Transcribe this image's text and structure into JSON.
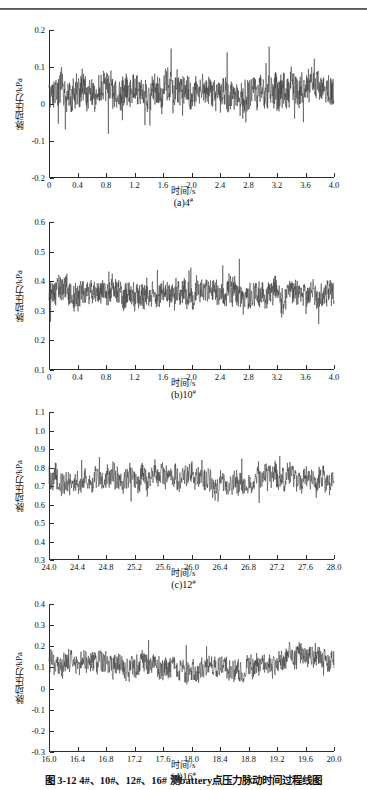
{
  "figure": {
    "caption": "图 3-12    4#、10#、12#、16# 测battery点压力脉动时间过程线图",
    "axis_title_y": "脉动压力/kPa",
    "axis_title_x": "时间/s"
  },
  "chart_data": [
    {
      "type": "line",
      "panel": "a",
      "caption_prefix": "(a)4",
      "caption_sup": "#",
      "title": "",
      "xlabel": "时间/s",
      "ylabel": "脉动压力/kPa",
      "xlim": [
        0,
        4.0
      ],
      "ylim": [
        -0.2,
        0.2
      ],
      "xticks": [
        "0",
        "0.4",
        "0.8",
        "1.2",
        "1.6",
        "2.0",
        "2.4",
        "2.8",
        "3.2",
        "3.6",
        "4.0"
      ],
      "xtickvals": [
        0,
        0.4,
        0.8,
        1.2,
        1.6,
        2.0,
        2.4,
        2.8,
        3.2,
        3.6,
        4.0
      ],
      "yticks": [
        "0.2",
        "0.1",
        "0",
        "-0.1",
        "-0.2"
      ],
      "ytickvals": [
        0.2,
        0.1,
        0,
        -0.1,
        -0.2
      ],
      "grid": false,
      "mean": 0.03,
      "noise_amp": 0.055,
      "spike_amp": 0.105,
      "seed": 11,
      "n": 1100
    },
    {
      "type": "line",
      "panel": "b",
      "caption_prefix": "(b)10",
      "caption_sup": "#",
      "title": "",
      "xlabel": "时间/s",
      "ylabel": "脉动压力/kPa",
      "xlim": [
        0,
        4.0
      ],
      "ylim": [
        0.1,
        0.6
      ],
      "xticks": [
        "0",
        "0.4",
        "0.8",
        "1.2",
        "1.6",
        "2.0",
        "2.4",
        "2.8",
        "3.2",
        "3.6",
        "4.0"
      ],
      "xtickvals": [
        0,
        0.4,
        0.8,
        1.2,
        1.6,
        2.0,
        2.4,
        2.8,
        3.2,
        3.6,
        4.0
      ],
      "yticks": [
        "0.6",
        "0.5",
        "0.4",
        "0.3",
        "0.2",
        "0.1"
      ],
      "ytickvals": [
        0.6,
        0.5,
        0.4,
        0.3,
        0.2,
        0.1
      ],
      "grid": false,
      "mean": 0.355,
      "noise_amp": 0.055,
      "spike_amp": 0.105,
      "seed": 29,
      "n": 1100
    },
    {
      "type": "line",
      "panel": "c",
      "caption_prefix": "(c)12",
      "caption_sup": "#",
      "title": "",
      "xlabel": "时间/s",
      "ylabel": "脉动压力/kPa",
      "xlim": [
        24.0,
        28.0
      ],
      "ylim": [
        0.3,
        1.1
      ],
      "xticks": [
        "24.0",
        "24.4",
        "24.8",
        "25.2",
        "25.6",
        "26.0",
        "26.4",
        "26.8",
        "27.2",
        "27.6",
        "28.0"
      ],
      "xtickvals": [
        24.0,
        24.4,
        24.8,
        25.2,
        25.6,
        26.0,
        26.4,
        26.8,
        27.2,
        27.6,
        28.0
      ],
      "yticks": [
        "1.1",
        "1.0",
        "0.9",
        "0.8",
        "0.7",
        "0.6",
        "0.5",
        "0.4",
        "0.3"
      ],
      "ytickvals": [
        1.1,
        1.0,
        0.9,
        0.8,
        0.7,
        0.6,
        0.5,
        0.4,
        0.3
      ],
      "grid": false,
      "mean": 0.735,
      "noise_amp": 0.085,
      "spike_amp": 0.155,
      "seed": 47,
      "n": 900
    },
    {
      "type": "line",
      "panel": "d",
      "caption_prefix": "(d)16",
      "caption_sup": "#",
      "title": "",
      "xlabel": "时间/s",
      "ylabel": "脉动压力/kPa",
      "xlim": [
        16.0,
        20.0
      ],
      "ylim": [
        -0.3,
        0.4
      ],
      "xticks": [
        "16.0",
        "16.4",
        "16.8",
        "17.2",
        "17.6",
        "18.0",
        "18.4",
        "18.8",
        "19.2",
        "19.6",
        "20.0"
      ],
      "xtickvals": [
        16.0,
        16.4,
        16.8,
        17.2,
        17.6,
        18.0,
        18.4,
        18.8,
        19.2,
        19.6,
        20.0
      ],
      "yticks": [
        "0.4",
        "0.3",
        "0.2",
        "0.1",
        "0",
        "-0.1",
        "-0.2",
        "-0.3"
      ],
      "ytickvals": [
        0.4,
        0.3,
        0.2,
        0.1,
        0,
        -0.1,
        -0.2,
        -0.3
      ],
      "grid": false,
      "mean": 0.115,
      "noise_amp": 0.072,
      "spike_amp": 0.125,
      "seed": 83,
      "n": 900
    }
  ]
}
